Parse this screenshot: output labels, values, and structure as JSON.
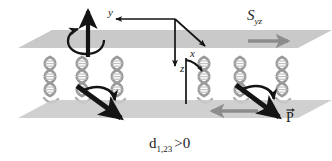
{
  "figure": {
    "background_color": "#ffffff",
    "plane_color": "#c9c9c9",
    "plane_color_dark": "#b9b9b9",
    "arrow_color": "#141414",
    "gray_arrow_color": "#8c8c8c",
    "helix_color": "#b0b0b0",
    "helix_outline_color": "#6e6e6e"
  },
  "axes": {
    "origin_label": "",
    "y_label": "y",
    "x_label": "x",
    "z_label": "z"
  },
  "labels": {
    "shear": "S",
    "shear_sub": "yz",
    "polarization": "P",
    "condition": "d",
    "condition_sub": "1,23",
    "condition_rel": ">0"
  },
  "annotations": {
    "rotation_axis_note": "vertical rotation arrow with circular spin",
    "tilt_note": "curved tilt arrow at right helix column",
    "upper_plane_shear_direction": "right",
    "lower_plane_shear_direction": "left"
  },
  "helices": {
    "left_group_count": 3,
    "right_group_count": 3,
    "description": "DNA double helix"
  }
}
